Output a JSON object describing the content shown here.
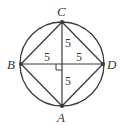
{
  "diagram": {
    "type": "geometry",
    "colors": {
      "stroke": "#3a3a3a",
      "background": "#ffffff"
    },
    "circle": {
      "cx": 62,
      "cy": 64,
      "r": 42
    },
    "points": {
      "A": {
        "label": "A",
        "x": 62,
        "y": 106
      },
      "B": {
        "label": "B",
        "x": 21,
        "y": 64
      },
      "C": {
        "label": "C",
        "x": 62,
        "y": 22
      },
      "D": {
        "label": "D",
        "x": 103,
        "y": 64
      }
    },
    "segment_labels": {
      "upper": "5",
      "left": "5",
      "right": "5",
      "lower": "5"
    },
    "right_angle_marker": true
  }
}
